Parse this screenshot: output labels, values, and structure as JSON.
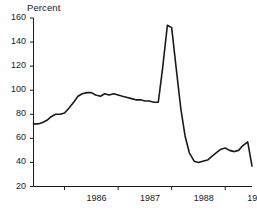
{
  "chart_data": {
    "type": "line",
    "title": "",
    "subtitle": "",
    "ylabel": "Percent",
    "xlabel": "",
    "ylim": [
      20,
      160
    ],
    "xlim": [
      1985.42,
      1989.5
    ],
    "yticks": [
      20,
      40,
      60,
      80,
      100,
      120,
      140,
      160
    ],
    "ytick_labels": [
      "20",
      "40",
      "60",
      "80",
      "100",
      "120",
      "140",
      "160"
    ],
    "xticks": [
      1986,
      1987,
      1988,
      1989
    ],
    "xtick_labels": [
      "1986",
      "1987",
      "1988",
      "1989"
    ],
    "grid": false,
    "legend": false,
    "legend_position": "none",
    "line_color": "#1a1a1a",
    "line_width": 1.6,
    "annotations": [],
    "series": [
      {
        "name": "Percent",
        "x": [
          1985.42,
          1985.5,
          1985.58,
          1985.67,
          1985.75,
          1985.83,
          1985.92,
          1986.0,
          1986.08,
          1986.17,
          1986.25,
          1986.33,
          1986.42,
          1986.5,
          1986.58,
          1986.67,
          1986.75,
          1986.83,
          1986.92,
          1987.0,
          1987.08,
          1987.17,
          1987.25,
          1987.33,
          1987.42,
          1987.5,
          1987.58,
          1987.67,
          1987.75,
          1987.83,
          1987.92,
          1988.0,
          1988.08,
          1988.17,
          1988.25,
          1988.33,
          1988.42,
          1988.5,
          1988.58,
          1988.67,
          1988.75,
          1988.83,
          1988.92,
          1989.0,
          1989.08,
          1989.17,
          1989.25,
          1989.33,
          1989.42,
          1989.5
        ],
        "values": [
          72,
          72,
          73,
          75,
          78,
          80,
          80,
          81,
          85,
          90,
          95,
          97,
          98,
          98,
          96,
          95,
          97,
          96,
          97,
          96,
          95,
          94,
          93,
          92,
          92,
          91,
          91,
          90,
          90,
          118,
          154,
          152,
          120,
          85,
          62,
          48,
          41,
          40,
          41,
          42,
          45,
          48,
          51,
          52,
          50,
          49,
          50,
          54,
          57,
          37
        ]
      }
    ]
  },
  "axis": {
    "y_title": "Percent"
  }
}
